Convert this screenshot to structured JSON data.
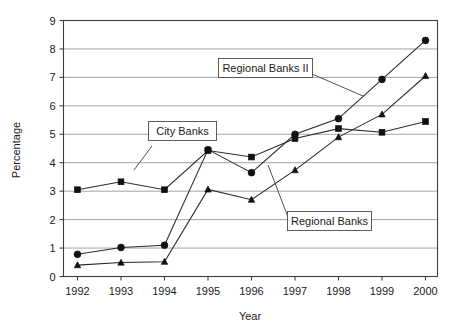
{
  "chart_data": {
    "type": "line",
    "title": "",
    "xlabel": "Year",
    "ylabel": "Percentage",
    "categories": [
      "1992",
      "1993",
      "1994",
      "1995",
      "1996",
      "1997",
      "1998",
      "1999",
      "2000"
    ],
    "x": [
      1992,
      1993,
      1994,
      1995,
      1996,
      1997,
      1998,
      1999,
      2000
    ],
    "xlim": [
      1992,
      2000
    ],
    "ylim": [
      0,
      9
    ],
    "ytick_labels": [
      "0",
      "1",
      "2",
      "3",
      "4",
      "5",
      "6",
      "7",
      "8",
      "9"
    ],
    "yticks": [
      0,
      1,
      2,
      3,
      4,
      5,
      6,
      7,
      8,
      9
    ],
    "grid": "horizontal",
    "legend": "none-inline-callouts",
    "series": [
      {
        "name": "City Banks",
        "marker": "square",
        "color": "#111111",
        "values": [
          3.05,
          3.33,
          3.05,
          4.43,
          4.2,
          4.85,
          5.2,
          5.07,
          5.45
        ]
      },
      {
        "name": "Regional Banks II",
        "marker": "circle",
        "color": "#111111",
        "values": [
          0.78,
          1.02,
          1.1,
          4.46,
          3.65,
          5.0,
          5.55,
          6.93,
          8.3
        ]
      },
      {
        "name": "Regional Banks",
        "marker": "triangle",
        "color": "#111111",
        "values": [
          0.4,
          0.49,
          0.52,
          3.06,
          2.7,
          3.74,
          4.9,
          5.7,
          7.05
        ]
      }
    ],
    "annotations": [
      {
        "label": "City Banks",
        "points_to_series": "City Banks",
        "points_to_x": 1993
      },
      {
        "label": "Regional Banks II",
        "points_to_series": "Regional Banks II",
        "points_to_x": 1999
      },
      {
        "label": "Regional Banks",
        "points_to_series": "Regional Banks",
        "points_to_x": 1998
      }
    ]
  },
  "axis": {
    "y_title": "Percentage",
    "x_title": "Year"
  },
  "callouts": {
    "city_banks": "City Banks",
    "regional_banks_ii": "Regional Banks II",
    "regional_banks": "Regional Banks"
  }
}
